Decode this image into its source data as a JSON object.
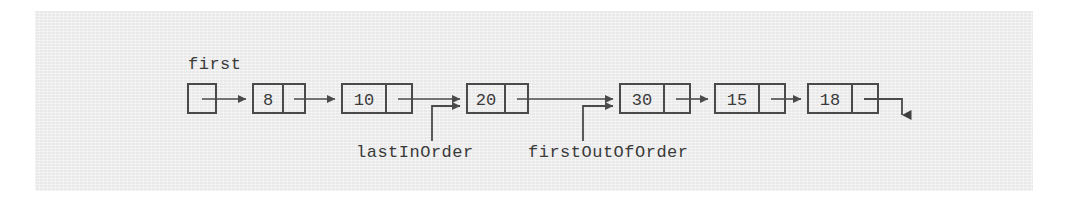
{
  "figure": {
    "type": "linked-list-diagram",
    "background_color": "#e9e9e9",
    "page_color": "#ffffff",
    "stroke_color": "#4a4a4a",
    "text_color": "#3a3a3a"
  },
  "head_pointer": {
    "label": "first",
    "box": {
      "x": 188,
      "y": 84,
      "w": 28,
      "h": 29
    }
  },
  "nodes": [
    {
      "value": "8",
      "x": 253,
      "y": 84,
      "w": 52,
      "h": 29,
      "split": 30
    },
    {
      "value": "10",
      "x": 342,
      "y": 84,
      "w": 70,
      "h": 29,
      "split": 44
    },
    {
      "value": "20",
      "x": 467,
      "y": 84,
      "w": 61,
      "h": 29,
      "split": 38
    },
    {
      "value": "30",
      "x": 620,
      "y": 84,
      "w": 70,
      "h": 29,
      "split": 44
    },
    {
      "value": "15",
      "x": 715,
      "y": 84,
      "w": 70,
      "h": 29,
      "split": 44
    },
    {
      "value": "18",
      "x": 808,
      "y": 84,
      "w": 70,
      "h": 29,
      "split": 44
    }
  ],
  "pointer_labels": [
    {
      "name": "lastInOrder",
      "text": "lastInOrder",
      "label_x": 356,
      "label_y": 152,
      "elbow_x": 432,
      "target_node_value": "20"
    },
    {
      "name": "firstOutOfOrder",
      "text": "firstOutOfOrder",
      "label_x": 528,
      "label_y": 152,
      "elbow_x": 583,
      "target_node_value": "30"
    }
  ],
  "terminator": {
    "description": "null-pointer down arrow",
    "x": 902,
    "top_y": 99,
    "bottom_y": 122
  }
}
